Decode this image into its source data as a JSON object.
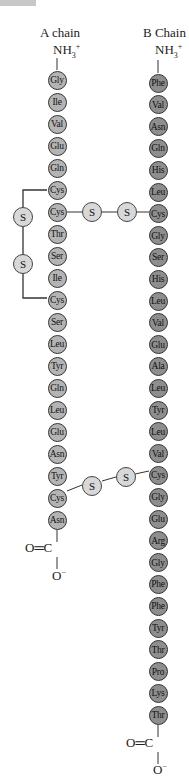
{
  "diagram": {
    "chain_a": {
      "label": "A chain",
      "n_terminus": "NH3+",
      "c_terminus": {
        "carbonyl": "O=C",
        "oxygen": "O−"
      },
      "residues": [
        "Gly",
        "Ile",
        "Val",
        "Glu",
        "Gln",
        "Cys",
        "Cys",
        "Thr",
        "Ser",
        "Ile",
        "Cys",
        "Ser",
        "Leu",
        "Tyr",
        "Gln",
        "Leu",
        "Glu",
        "Asn",
        "Tyr",
        "Cys",
        "Asn"
      ]
    },
    "chain_b": {
      "label": "B Chain",
      "n_terminus": "NH3+",
      "c_terminus": {
        "carbonyl": "O=C",
        "oxygen": "O−"
      },
      "residues": [
        "Phe",
        "Val",
        "Asn",
        "Gln",
        "His",
        "Leu",
        "Cys",
        "Gly",
        "Ser",
        "His",
        "Leu",
        "Val",
        "Glu",
        "Ala",
        "Leu",
        "Tyr",
        "Leu",
        "Val",
        "Cys",
        "Gly",
        "Glu",
        "Arg",
        "Gly",
        "Phe",
        "Phe",
        "Tyr",
        "Thr",
        "Pro",
        "Lys",
        "Thr"
      ]
    },
    "disulfide_bonds": [
      {
        "type": "intrachain",
        "from": "A6 Cys",
        "to": "A11 Cys",
        "atoms": [
          "S",
          "S"
        ]
      },
      {
        "type": "interchain",
        "from": "A7 Cys",
        "to": "B7 Cys",
        "atoms": [
          "S",
          "S"
        ]
      },
      {
        "type": "interchain",
        "from": "A20 Cys",
        "to": "B19 Cys",
        "atoms": [
          "S",
          "S"
        ]
      }
    ],
    "text": {
      "a_label": "A chain",
      "b_label": "B Chain",
      "nh3": "NH",
      "nh3_sub": "3",
      "nh3_sup": "+",
      "o_eq_c": "O═C",
      "o_minus": "O",
      "o_minus_sup": "−",
      "s": "S"
    },
    "colors": {
      "a_residue": "#b4b4b4",
      "b_residue": "#8e8e8e",
      "sulfur": "#d8d8d8",
      "line": "#333333"
    }
  }
}
